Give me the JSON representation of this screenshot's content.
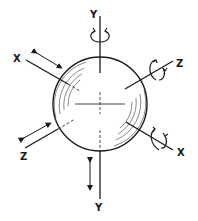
{
  "diagram": {
    "type": "sphere-degrees-of-freedom",
    "colors": {
      "stroke": "#1a1a1a",
      "background": "#ffffff",
      "hatch": "#555555"
    },
    "labels": {
      "y_top": "Y",
      "y_bottom": "Y",
      "x_left": "X",
      "x_right": "X",
      "z_right": "Z",
      "z_left": "Z"
    },
    "axes": [
      {
        "name": "Y",
        "motion_top": "rotation",
        "motion_bottom": "translation"
      },
      {
        "name": "X",
        "motion_left": "translation",
        "motion_right": "rotation"
      },
      {
        "name": "Z",
        "motion_right": "rotation",
        "motion_left": "translation"
      }
    ]
  }
}
